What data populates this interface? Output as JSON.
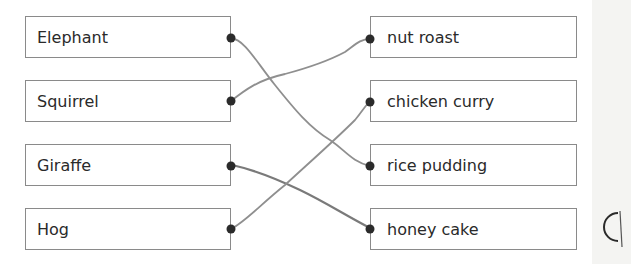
{
  "exercise": {
    "left_items": [
      {
        "label": "Elephant"
      },
      {
        "label": "Squirrel"
      },
      {
        "label": "Giraffe"
      },
      {
        "label": "Hog"
      }
    ],
    "right_items": [
      {
        "label": "nut roast"
      },
      {
        "label": "chicken curry"
      },
      {
        "label": "rice pudding"
      },
      {
        "label": "honey cake"
      }
    ],
    "connections": [
      {
        "from": "Elephant",
        "to": "rice pudding"
      },
      {
        "from": "Squirrel",
        "to": "nut roast"
      },
      {
        "from": "Giraffe",
        "to": "honey cake"
      },
      {
        "from": "Hog",
        "to": "chicken curry"
      }
    ],
    "colors": {
      "box_border": "#8a8a8a",
      "line": "#8f8f8f",
      "dot": "#2b2b2b"
    }
  }
}
